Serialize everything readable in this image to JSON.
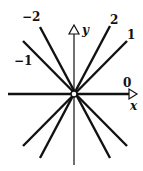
{
  "diagram": {
    "title": "",
    "axes": {
      "x_label": "x",
      "y_label": "y"
    },
    "lines": [
      {
        "slope": 2,
        "label": "2"
      },
      {
        "slope": 1,
        "label": "1"
      },
      {
        "slope": 0,
        "label": "0"
      },
      {
        "slope": -1,
        "label": "−1"
      },
      {
        "slope": -2,
        "label": "−2"
      }
    ],
    "origin_marker": "open-circle",
    "colors": {
      "line": "#111111",
      "background": "#ffffff"
    }
  }
}
